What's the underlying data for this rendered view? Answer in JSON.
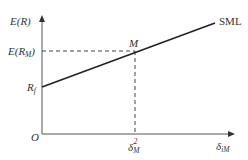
{
  "diagram": {
    "y_axis_label": "E(R)",
    "x_axis_label": "δiM",
    "origin_label": "O",
    "risk_free_label": "Rf",
    "market_return_label": "E(RM)",
    "market_point_label": "M",
    "market_variance_label": "δM²",
    "line_label": "SML",
    "colors": {
      "axis": "#555555",
      "line": "#222222",
      "dash": "#444444",
      "text": "#333333"
    }
  }
}
